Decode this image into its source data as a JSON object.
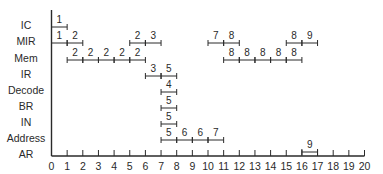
{
  "diagram": {
    "type": "timing-diagram",
    "x_axis": {
      "min": 0,
      "max": 20,
      "ticks": [
        "0",
        "1",
        "2",
        "3",
        "4",
        "5",
        "6",
        "7",
        "8",
        "9",
        "10",
        "11",
        "12",
        "13",
        "14",
        "15",
        "16",
        "17",
        "18",
        "19",
        "20"
      ]
    },
    "colors": {
      "line": "#2a2a2a",
      "text": "#2a2a2a",
      "background": "#ffffff"
    },
    "rows": [
      {
        "label": "IC",
        "segments": [
          {
            "start": 0,
            "end": 1,
            "label": "1"
          }
        ]
      },
      {
        "label": "MIR",
        "segments": [
          {
            "start": 0,
            "end": 1,
            "label": "1"
          },
          {
            "start": 1,
            "end": 2,
            "label": "2"
          },
          {
            "start": 5,
            "end": 6,
            "label": "2"
          },
          {
            "start": 6,
            "end": 7,
            "label": "3"
          },
          {
            "start": 10,
            "end": 11,
            "label": "7"
          },
          {
            "start": 11,
            "end": 12,
            "label": "8"
          },
          {
            "start": 15,
            "end": 16,
            "label": "8"
          },
          {
            "start": 16,
            "end": 17,
            "label": "9"
          }
        ]
      },
      {
        "label": "Mem",
        "segments": [
          {
            "start": 1,
            "end": 2,
            "label": "2"
          },
          {
            "start": 2,
            "end": 3,
            "label": "2"
          },
          {
            "start": 3,
            "end": 4,
            "label": "2"
          },
          {
            "start": 4,
            "end": 5,
            "label": "2"
          },
          {
            "start": 5,
            "end": 6,
            "label": "2"
          },
          {
            "start": 11,
            "end": 12,
            "label": "8"
          },
          {
            "start": 12,
            "end": 13,
            "label": "8"
          },
          {
            "start": 13,
            "end": 14,
            "label": "8"
          },
          {
            "start": 14,
            "end": 15,
            "label": "8"
          },
          {
            "start": 15,
            "end": 16,
            "label": "8"
          }
        ]
      },
      {
        "label": "IR",
        "segments": [
          {
            "start": 6,
            "end": 7,
            "label": "3"
          },
          {
            "start": 7,
            "end": 8,
            "label": "5"
          }
        ]
      },
      {
        "label": "Decode",
        "segments": [
          {
            "start": 7,
            "end": 8,
            "label": "4"
          }
        ]
      },
      {
        "label": "BR",
        "segments": [
          {
            "start": 7,
            "end": 8,
            "label": "5"
          }
        ]
      },
      {
        "label": "IN",
        "segments": [
          {
            "start": 7,
            "end": 8,
            "label": "5"
          }
        ]
      },
      {
        "label": "Address",
        "segments": [
          {
            "start": 7,
            "end": 8,
            "label": "5"
          },
          {
            "start": 8,
            "end": 9,
            "label": "6"
          },
          {
            "start": 9,
            "end": 10,
            "label": "6"
          },
          {
            "start": 10,
            "end": 11,
            "label": "7"
          }
        ]
      },
      {
        "label": "AR",
        "segments": [
          {
            "start": 16,
            "end": 17,
            "label": "9"
          }
        ]
      }
    ]
  }
}
